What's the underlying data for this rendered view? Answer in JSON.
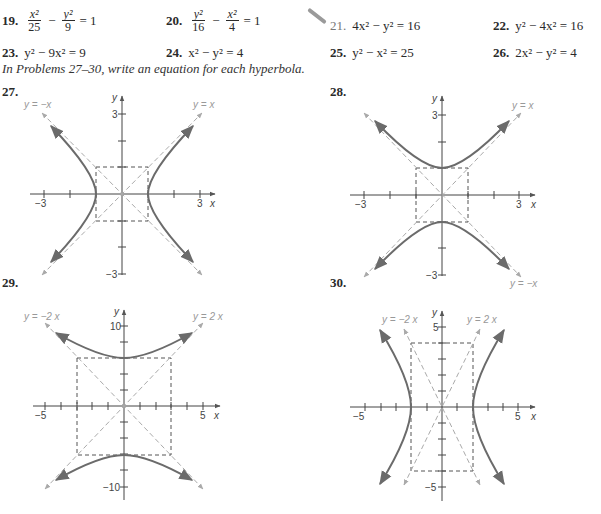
{
  "problems_row1": [
    {
      "number": "19.",
      "type": "fraction",
      "t1_num": "x²",
      "t1_den": "25",
      "op": "−",
      "t2_num": "y²",
      "t2_den": "9",
      "rhs": "= 1"
    },
    {
      "number": "20.",
      "type": "fraction",
      "t1_num": "y²",
      "t1_den": "16",
      "op": "−",
      "t2_num": "x²",
      "t2_den": "4",
      "rhs": "= 1"
    },
    {
      "number": "21.",
      "equation": "4x² − y² = 16",
      "marked": true
    },
    {
      "number": "22.",
      "equation": "y² − 4x² = 16"
    }
  ],
  "problems_row2": [
    {
      "number": "23.",
      "equation": "y² − 9x² = 9"
    },
    {
      "number": "24.",
      "equation": "x² − y² = 4"
    },
    {
      "number": "25.",
      "equation": "y² − x² = 25"
    },
    {
      "number": "26.",
      "equation": "2x² − y² = 4"
    }
  ],
  "instructions": "In Problems 27–30, write an equation for each hyperbola.",
  "graphs": [
    {
      "number": "27.",
      "x_tick_labels": [
        "−3",
        "3"
      ],
      "y_tick_labels": [
        "3",
        "−3"
      ],
      "x_label": "x",
      "y_label": "y",
      "asymptotes": [
        "y = −x",
        "y = x"
      ]
    },
    {
      "number": "28.",
      "x_tick_labels": [
        "−3",
        "3"
      ],
      "y_tick_labels": [
        "3",
        "−3"
      ],
      "x_label": "x",
      "y_label": "y",
      "asymptotes": [
        "y = x",
        "y = −x"
      ]
    },
    {
      "number": "29.",
      "x_tick_labels": [
        "−5",
        "5"
      ],
      "y_tick_labels": [
        "10",
        "−10"
      ],
      "x_label": "x",
      "y_label": "y",
      "asymptotes": [
        "y = −2 x",
        "y = 2 x"
      ]
    },
    {
      "number": "30.",
      "x_tick_labels": [
        "−5",
        "5"
      ],
      "y_tick_labels": [
        "5",
        "−5"
      ],
      "x_label": "x",
      "y_label": "y",
      "asymptotes": [
        "y = −2 x",
        "y = 2 x"
      ]
    }
  ],
  "colors": {
    "curve": "#6b6b6b",
    "asymptote": "#aaaaaa",
    "box": "#555555",
    "axis": "#444444"
  }
}
